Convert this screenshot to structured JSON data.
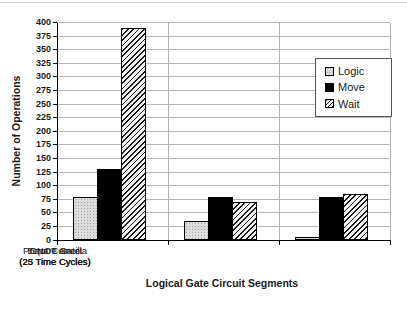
{
  "chart_data": {
    "type": "bar",
    "title": "",
    "categories": [
      {
        "line1": "Prepare Ancilla",
        "line2": "(25 Time Cycles)"
      },
      {
        "line1": "Error Correct",
        "line2": "(25 Time Cycles)"
      },
      {
        "line1": "CNOT Gate",
        "line2": "(23 Time Cycles)"
      }
    ],
    "series": [
      {
        "name": "Logic",
        "style": "speckled-light-gray",
        "values": [
          80,
          35,
          5
        ]
      },
      {
        "name": "Move",
        "style": "solid-black",
        "values": [
          130,
          80,
          80
        ]
      },
      {
        "name": "Wait",
        "style": "diagonal-hatch",
        "values": [
          390,
          70,
          85
        ]
      }
    ],
    "xlabel": "Logical Gate Circuit Segments",
    "ylabel": "Number of Operations",
    "ylim": [
      0,
      400
    ],
    "ytick_step": 25,
    "grid": "horizontal",
    "legend_position": "inside-top-right"
  },
  "colors": {
    "background": "#ffffff",
    "logic_fill": "#dcdcdc",
    "move_fill": "#000000",
    "hatch_stroke": "#1a1a1a",
    "gridline": "#b5b5b5",
    "axis": "#000000",
    "text": "#1a1a1a"
  }
}
